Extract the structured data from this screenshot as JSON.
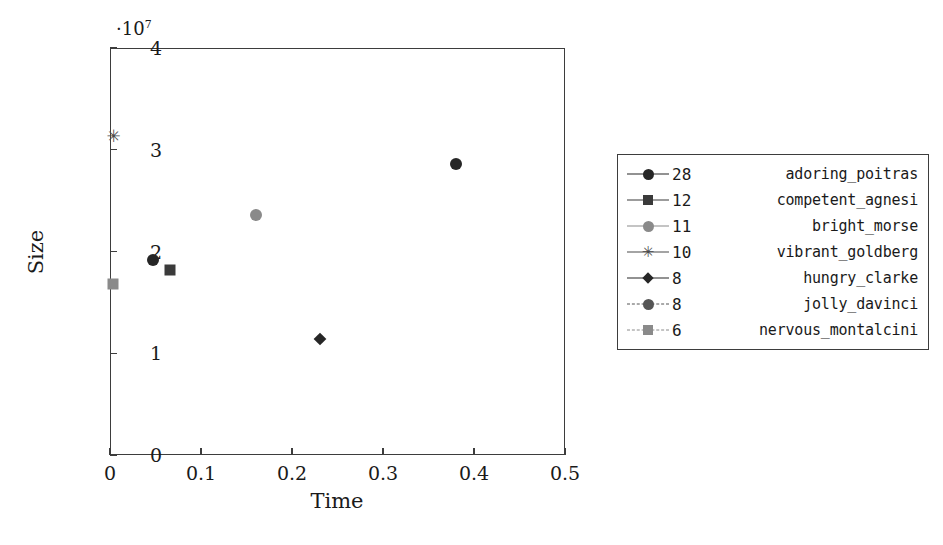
{
  "chart_data": {
    "type": "scatter",
    "title": "",
    "xlabel": "Time",
    "ylabel": "Size",
    "xlim": [
      0,
      0.5
    ],
    "ylim": [
      0,
      40000000
    ],
    "y_multiplier_text": "·10",
    "y_multiplier_exp": "7",
    "grid": false,
    "legend_position": "right",
    "xticks": [
      "0",
      "0.1",
      "0.2",
      "0.3",
      "0.4",
      "0.5"
    ],
    "xtick_values": [
      0,
      0.1,
      0.2,
      0.3,
      0.4,
      0.5
    ],
    "yticks": [
      "0",
      "1",
      "2",
      "3",
      "4"
    ],
    "ytick_values": [
      0,
      10000000,
      20000000,
      30000000,
      40000000
    ],
    "series": [
      {
        "name": "adoring_poitras",
        "count": "28",
        "marker": "circle",
        "color": "#262626",
        "linestyle": "solid",
        "points": [
          {
            "x": 0.047,
            "y": 19200000
          },
          {
            "x": 0.38,
            "y": 28600000
          }
        ]
      },
      {
        "name": "competent_agnesi",
        "count": "12",
        "marker": "square",
        "color": "#3a3a3a",
        "linestyle": "solid",
        "points": [
          {
            "x": 0.066,
            "y": 18200000
          }
        ]
      },
      {
        "name": "bright_morse",
        "count": "11",
        "marker": "circle",
        "color": "#8a8a8a",
        "linestyle": "solid",
        "points": [
          {
            "x": 0.16,
            "y": 23600000
          }
        ]
      },
      {
        "name": "vibrant_goldberg",
        "count": "10",
        "marker": "star",
        "color": "#4a4a4a",
        "linestyle": "solid",
        "points": [
          {
            "x": 0.004,
            "y": 31400000
          }
        ]
      },
      {
        "name": "hungry_clarke",
        "count": "8",
        "marker": "diamond",
        "color": "#262626",
        "linestyle": "solid",
        "points": [
          {
            "x": 0.231,
            "y": 11400000
          }
        ]
      },
      {
        "name": "jolly_davinci",
        "count": "8",
        "marker": "circle",
        "color": "#555555",
        "linestyle": "dashed",
        "points": []
      },
      {
        "name": "nervous_montalcini",
        "count": "6",
        "marker": "square",
        "color": "#8a8a8a",
        "linestyle": "dashed",
        "points": [
          {
            "x": 0.003,
            "y": 16800000
          }
        ]
      }
    ]
  },
  "axes": {
    "frame_color": "#3d3d3d"
  }
}
